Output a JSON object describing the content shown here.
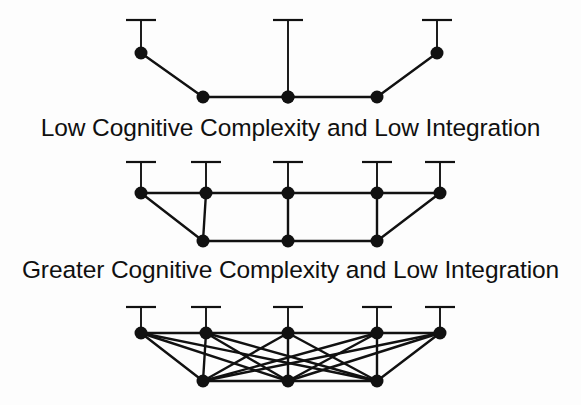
{
  "figure": {
    "background_color": "#fdfdfd",
    "ink_color": "#111111",
    "node_color": "#111111",
    "node_radius": 6.5,
    "edge_width": 2.4,
    "stem_width": 1.9,
    "cap_width": 30,
    "cap_thickness": 2.2
  },
  "captions": {
    "first": "Low Cognitive Complexity and Low Integration",
    "second": "Greater Cognitive Complexity and Low Integration"
  },
  "diagrams": [
    {
      "id": "diagram-1",
      "label": "Low Cognitive Complexity and Low Integration",
      "top_nodes": [
        {
          "id": "t1",
          "x": 141,
          "y": 53
        },
        {
          "id": "t2",
          "x": 288,
          "y": 97
        },
        {
          "id": "t3",
          "x": 437,
          "y": 53
        }
      ],
      "stems": [
        {
          "x": 141,
          "y_top": 20,
          "y_bottom": 53
        },
        {
          "x": 288,
          "y_top": 20,
          "y_bottom": 97
        },
        {
          "x": 437,
          "y_top": 20,
          "y_bottom": 53
        }
      ],
      "caps": [
        {
          "x": 141,
          "y": 20
        },
        {
          "x": 288,
          "y": 20
        },
        {
          "x": 437,
          "y": 20
        }
      ],
      "bottom_nodes": [
        {
          "id": "b1",
          "x": 203,
          "y": 97
        },
        {
          "id": "b2",
          "x": 288,
          "y": 97
        },
        {
          "id": "b3",
          "x": 377,
          "y": 97
        }
      ],
      "edges": [
        {
          "from": [
            141,
            53
          ],
          "to": [
            203,
            97
          ]
        },
        {
          "from": [
            203,
            97
          ],
          "to": [
            288,
            97
          ]
        },
        {
          "from": [
            288,
            97
          ],
          "to": [
            377,
            97
          ]
        },
        {
          "from": [
            377,
            97
          ],
          "to": [
            437,
            53
          ]
        }
      ],
      "edge_count": 4,
      "node_count": 5
    },
    {
      "id": "diagram-2",
      "label": "Greater Cognitive Complexity and Low Integration",
      "top_nodes": [
        {
          "id": "t1",
          "x": 141,
          "y": 193
        },
        {
          "id": "t2",
          "x": 206,
          "y": 193
        },
        {
          "id": "t3",
          "x": 288,
          "y": 193
        },
        {
          "id": "t4",
          "x": 377,
          "y": 193
        },
        {
          "id": "t5",
          "x": 440,
          "y": 193
        }
      ],
      "stems": [
        {
          "x": 141,
          "y_top": 162,
          "y_bottom": 193
        },
        {
          "x": 206,
          "y_top": 162,
          "y_bottom": 193
        },
        {
          "x": 288,
          "y_top": 162,
          "y_bottom": 193
        },
        {
          "x": 377,
          "y_top": 162,
          "y_bottom": 193
        },
        {
          "x": 440,
          "y_top": 162,
          "y_bottom": 193
        }
      ],
      "caps": [
        {
          "x": 141,
          "y": 162
        },
        {
          "x": 206,
          "y": 162
        },
        {
          "x": 288,
          "y": 162
        },
        {
          "x": 377,
          "y": 162
        },
        {
          "x": 440,
          "y": 162
        }
      ],
      "bottom_nodes": [
        {
          "id": "b1",
          "x": 203,
          "y": 241
        },
        {
          "id": "b2",
          "x": 288,
          "y": 241
        },
        {
          "id": "b3",
          "x": 377,
          "y": 241
        }
      ],
      "edges": [
        {
          "from": [
            141,
            193
          ],
          "to": [
            206,
            193
          ]
        },
        {
          "from": [
            206,
            193
          ],
          "to": [
            288,
            193
          ]
        },
        {
          "from": [
            288,
            193
          ],
          "to": [
            377,
            193
          ]
        },
        {
          "from": [
            377,
            193
          ],
          "to": [
            440,
            193
          ]
        },
        {
          "from": [
            141,
            193
          ],
          "to": [
            203,
            241
          ]
        },
        {
          "from": [
            206,
            193
          ],
          "to": [
            203,
            241
          ]
        },
        {
          "from": [
            288,
            193
          ],
          "to": [
            288,
            241
          ]
        },
        {
          "from": [
            377,
            193
          ],
          "to": [
            377,
            241
          ]
        },
        {
          "from": [
            440,
            193
          ],
          "to": [
            377,
            241
          ]
        },
        {
          "from": [
            203,
            241
          ],
          "to": [
            288,
            241
          ]
        },
        {
          "from": [
            288,
            241
          ],
          "to": [
            377,
            241
          ]
        }
      ],
      "edge_count": 11,
      "node_count": 8
    },
    {
      "id": "diagram-3",
      "label": "",
      "top_nodes": [
        {
          "id": "t1",
          "x": 141,
          "y": 333
        },
        {
          "id": "t2",
          "x": 206,
          "y": 333
        },
        {
          "id": "t3",
          "x": 288,
          "y": 333
        },
        {
          "id": "t4",
          "x": 377,
          "y": 333
        },
        {
          "id": "t5",
          "x": 440,
          "y": 333
        }
      ],
      "stems": [
        {
          "x": 141,
          "y_top": 307,
          "y_bottom": 333
        },
        {
          "x": 206,
          "y_top": 307,
          "y_bottom": 333
        },
        {
          "x": 288,
          "y_top": 307,
          "y_bottom": 333
        },
        {
          "x": 377,
          "y_top": 307,
          "y_bottom": 333
        },
        {
          "x": 440,
          "y_top": 307,
          "y_bottom": 333
        }
      ],
      "caps": [
        {
          "x": 141,
          "y": 307
        },
        {
          "x": 206,
          "y": 307
        },
        {
          "x": 288,
          "y": 307
        },
        {
          "x": 377,
          "y": 307
        },
        {
          "x": 440,
          "y": 307
        }
      ],
      "bottom_nodes": [
        {
          "id": "b1",
          "x": 203,
          "y": 381
        },
        {
          "id": "b2",
          "x": 288,
          "y": 381
        },
        {
          "id": "b3",
          "x": 377,
          "y": 381
        }
      ],
      "edges": [
        {
          "from": [
            141,
            333
          ],
          "to": [
            206,
            333
          ]
        },
        {
          "from": [
            206,
            333
          ],
          "to": [
            288,
            333
          ]
        },
        {
          "from": [
            288,
            333
          ],
          "to": [
            377,
            333
          ]
        },
        {
          "from": [
            377,
            333
          ],
          "to": [
            440,
            333
          ]
        },
        {
          "from": [
            141,
            333
          ],
          "to": [
            203,
            381
          ]
        },
        {
          "from": [
            141,
            333
          ],
          "to": [
            288,
            381
          ]
        },
        {
          "from": [
            141,
            333
          ],
          "to": [
            377,
            381
          ]
        },
        {
          "from": [
            206,
            333
          ],
          "to": [
            203,
            381
          ]
        },
        {
          "from": [
            206,
            333
          ],
          "to": [
            288,
            381
          ]
        },
        {
          "from": [
            206,
            333
          ],
          "to": [
            377,
            381
          ]
        },
        {
          "from": [
            288,
            333
          ],
          "to": [
            203,
            381
          ]
        },
        {
          "from": [
            288,
            333
          ],
          "to": [
            288,
            381
          ]
        },
        {
          "from": [
            288,
            333
          ],
          "to": [
            377,
            381
          ]
        },
        {
          "from": [
            377,
            333
          ],
          "to": [
            203,
            381
          ]
        },
        {
          "from": [
            377,
            333
          ],
          "to": [
            288,
            381
          ]
        },
        {
          "from": [
            377,
            333
          ],
          "to": [
            377,
            381
          ]
        },
        {
          "from": [
            440,
            333
          ],
          "to": [
            203,
            381
          ]
        },
        {
          "from": [
            440,
            333
          ],
          "to": [
            288,
            381
          ]
        },
        {
          "from": [
            440,
            333
          ],
          "to": [
            377,
            381
          ]
        },
        {
          "from": [
            203,
            381
          ],
          "to": [
            288,
            381
          ]
        },
        {
          "from": [
            288,
            381
          ],
          "to": [
            377,
            381
          ]
        }
      ],
      "edge_count": 21,
      "node_count": 8
    }
  ]
}
